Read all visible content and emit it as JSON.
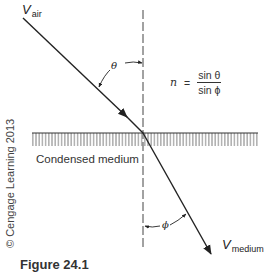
{
  "figure": {
    "caption": "Figure 24.1",
    "credit": "© Cengage Learning 2013",
    "labels": {
      "incident_vector": {
        "main": "V",
        "sub": "air"
      },
      "refracted_vector": {
        "main": "V",
        "sub": "medium"
      },
      "incident_angle": "θ",
      "refraction_angle": "ϕ",
      "medium": "Condensed medium"
    },
    "formula": {
      "lhs": "n",
      "equals": "=",
      "numerator": "sin θ",
      "denominator": "sin ϕ"
    }
  },
  "colors": {
    "line": "#222222",
    "dashed": "#444444",
    "hatch": "#555555",
    "background": "#ffffff"
  }
}
